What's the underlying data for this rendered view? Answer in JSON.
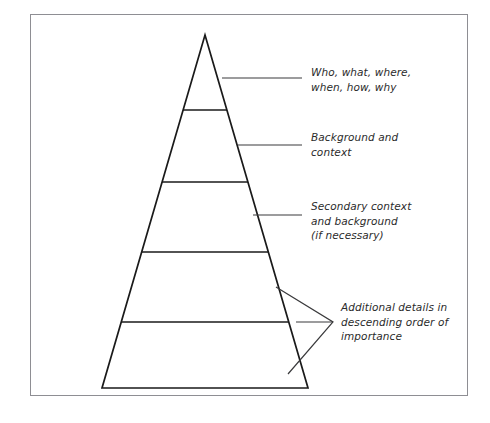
{
  "figure": {
    "type": "inverted-pyramid-diagram",
    "shape_name": "pyramid",
    "tier_count": 5,
    "line_color": "#1a1a1a",
    "frame_color": "#8e8e93",
    "background_color": "#ffffff",
    "annotations": [
      {
        "id": "annotation-0",
        "tier": 1,
        "leader": "line",
        "text": "Who, what, where,\nwhen, how, why"
      },
      {
        "id": "annotation-1",
        "tier": 2,
        "leader": "line",
        "text": "Background and\ncontext"
      },
      {
        "id": "annotation-2",
        "tier": 3,
        "leader": "line",
        "text": "Secondary context\nand background\n(if necessary)"
      },
      {
        "id": "annotation-3",
        "tier": "4-5",
        "leader": "wedge-bracket",
        "text": "Additional details in\ndescending order of\nimportance"
      }
    ]
  },
  "caption": {
    "label": "",
    "text": ""
  }
}
